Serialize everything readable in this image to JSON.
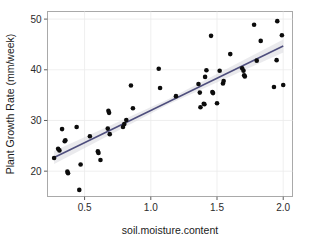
{
  "chart_data": {
    "type": "scatter",
    "title": "",
    "xlabel": "soil.moisture.content",
    "ylabel": "Plant Growth Rate (mm/week)",
    "xlim": [
      0.22,
      2.07
    ],
    "ylim": [
      15.0,
      51.5
    ],
    "xticks": [
      0.5,
      1.0,
      1.5,
      2.0
    ],
    "xtick_labels": [
      "0.5",
      "1.0",
      "1.5",
      "2.0"
    ],
    "yticks": [
      20,
      30,
      40,
      50
    ],
    "ytick_labels": [
      "20",
      "30",
      "40",
      "50"
    ],
    "grid": true,
    "legend": "none",
    "point_color": "#0c0c0c",
    "line_color": "#4e4e7d",
    "ci_band_color": "#d9d9df",
    "panel_background": "#ffffff",
    "gridline_color": "#ebebeb",
    "border_color": "#a9a9a9",
    "fit": {
      "type": "linear-regression",
      "slope": 12.7,
      "intercept": 19.3,
      "x_start": 0.27,
      "x_end": 2.0,
      "y_start": 22.7,
      "y_end": 44.7,
      "show_confidence_band": true
    },
    "n_points": 58,
    "points": [
      [
        0.27,
        22.6
      ],
      [
        0.3,
        24.4
      ],
      [
        0.31,
        24.1
      ],
      [
        0.33,
        28.3
      ],
      [
        0.35,
        25.9
      ],
      [
        0.355,
        26.1
      ],
      [
        0.37,
        19.9
      ],
      [
        0.375,
        19.6
      ],
      [
        0.44,
        28.7
      ],
      [
        0.46,
        16.3
      ],
      [
        0.47,
        21.3
      ],
      [
        0.54,
        26.9
      ],
      [
        0.6,
        23.9
      ],
      [
        0.605,
        23.6
      ],
      [
        0.62,
        22.2
      ],
      [
        0.675,
        28.4
      ],
      [
        0.68,
        31.9
      ],
      [
        0.685,
        31.5
      ],
      [
        0.69,
        27.3
      ],
      [
        0.79,
        28.7
      ],
      [
        0.8,
        29.3
      ],
      [
        0.815,
        30.1
      ],
      [
        0.85,
        36.9
      ],
      [
        0.865,
        32.4
      ],
      [
        1.06,
        40.2
      ],
      [
        1.07,
        36.4
      ],
      [
        1.19,
        34.8
      ],
      [
        1.36,
        37.2
      ],
      [
        1.37,
        35.5
      ],
      [
        1.375,
        32.6
      ],
      [
        1.4,
        33.3
      ],
      [
        1.405,
        33.2
      ],
      [
        1.41,
        38.6
      ],
      [
        1.42,
        39.9
      ],
      [
        1.455,
        46.7
      ],
      [
        1.465,
        35.6
      ],
      [
        1.47,
        35.4
      ],
      [
        1.5,
        33.4
      ],
      [
        1.52,
        39.8
      ],
      [
        1.545,
        37.3
      ],
      [
        1.55,
        37.8
      ],
      [
        1.6,
        43.1
      ],
      [
        1.69,
        40.3
      ],
      [
        1.7,
        39.8
      ],
      [
        1.705,
        38.9
      ],
      [
        1.71,
        38.7
      ],
      [
        1.78,
        48.9
      ],
      [
        1.8,
        41.8
      ],
      [
        1.83,
        45.7
      ],
      [
        1.93,
        36.6
      ],
      [
        1.95,
        41.9
      ],
      [
        1.955,
        49.6
      ],
      [
        1.99,
        46.8
      ],
      [
        2.0,
        37.0
      ]
    ]
  }
}
